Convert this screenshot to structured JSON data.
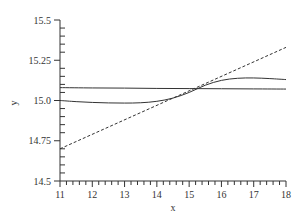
{
  "chart_data": {
    "type": "line",
    "title": "",
    "xlabel": "x",
    "ylabel": "y",
    "xlim": [
      11,
      18
    ],
    "ylim": [
      14.5,
      15.5
    ],
    "grid": false,
    "legend": null,
    "x_ticks": [
      11,
      12,
      13,
      14,
      15,
      16,
      17,
      18
    ],
    "x_tick_labels": [
      "11",
      "12",
      "13",
      "14",
      "15",
      "16",
      "17",
      "18"
    ],
    "y_ticks": [
      14.5,
      14.75,
      15.0,
      15.25,
      15.5
    ],
    "y_tick_labels": [
      "14.5",
      "14.75",
      "15.0",
      "15.25",
      "15.5"
    ],
    "series": [
      {
        "name": "horizontal",
        "style": "solid",
        "x": [
          11,
          12,
          13,
          14,
          15,
          16,
          17,
          18
        ],
        "y": [
          15.08,
          15.078,
          15.077,
          15.075,
          15.074,
          15.073,
          15.072,
          15.071
        ]
      },
      {
        "name": "curve",
        "style": "solid",
        "x": [
          11,
          11.5,
          12,
          12.5,
          13,
          13.5,
          14,
          14.5,
          15,
          15.5,
          16,
          16.5,
          17,
          17.5,
          18
        ],
        "y": [
          15.0,
          14.993,
          14.988,
          14.985,
          14.984,
          14.986,
          14.995,
          15.015,
          15.05,
          15.095,
          15.125,
          15.138,
          15.14,
          15.136,
          15.13
        ]
      },
      {
        "name": "dashed",
        "style": "dashed",
        "x": [
          11,
          18
        ],
        "y": [
          14.7,
          15.33
        ]
      }
    ]
  }
}
